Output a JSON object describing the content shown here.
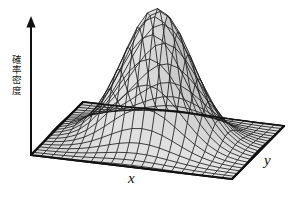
{
  "figure": {
    "background_color": "#ffffff",
    "width": 291,
    "height": 203
  },
  "axes": {
    "vertical": {
      "label": "確率密度",
      "has_arrow": true,
      "arrow_direction": "up",
      "color": "#111111"
    },
    "x": {
      "label": "x",
      "color": "#111111"
    },
    "y": {
      "label": "y",
      "color": "#111111"
    }
  },
  "chart_data": {
    "type": "surface",
    "title": "",
    "xlabel": "x",
    "ylabel": "y",
    "zlabel": "確率密度",
    "grid": true,
    "legend": null,
    "colormap": "grayscale",
    "surface": {
      "function": "bivariate-gaussian",
      "amplitude": 1.0,
      "mean": [
        0.0,
        0.0
      ],
      "sigma_x": 0.34,
      "sigma_y": 0.34,
      "correlation": 0.0,
      "x_range": [
        -1,
        1
      ],
      "y_range": [
        -1,
        1
      ],
      "z_range": [
        0,
        1
      ],
      "mesh_rows": 20,
      "mesh_cols": 20
    },
    "projection": {
      "type": "oblique-isometric",
      "azimuth_deg": 38,
      "elevation_deg": 24
    },
    "style": {
      "mesh_line_color": "#1f1f1f",
      "face_light_color": "#f2f2f2",
      "face_dark_color": "#8a8a8a",
      "base_outline_color": "#111111",
      "base_fill_color": "#ffffff"
    }
  }
}
